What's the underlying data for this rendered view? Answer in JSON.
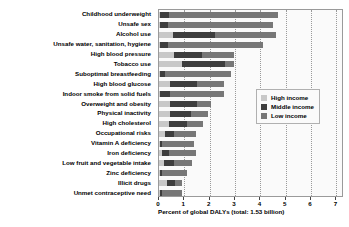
{
  "chart_data": {
    "type": "bar",
    "orientation": "horizontal",
    "stacked": true,
    "title": "",
    "xlabel": "Percent of global DALYs (total: 1.53 billion)",
    "ylabel": "",
    "xlim": [
      0,
      7.3
    ],
    "xticks": [
      0,
      1,
      2,
      3,
      4,
      5,
      6,
      7
    ],
    "xtick_labels": [
      "0",
      "1",
      "2",
      "3",
      "4",
      "5",
      "6",
      "7"
    ],
    "grid": "vertical-dotted",
    "legend_position": "middle-right",
    "categories": [
      "Childhood underweight",
      "Unsafe sex",
      "Alcohol use",
      "Unsafe water, sanitation, hygiene",
      "High blood pressure",
      "Tobacco use",
      "Suboptimal breastfeeding",
      "High blood glucose",
      "Indoor smoke from solid fuels",
      "Overweight and obesity",
      "Physical inactivity",
      "High cholesterol",
      "Occupational risks",
      "Vitamin A deficiency",
      "Iron deficiency",
      "Low fruit and vegetable intake",
      "Zinc deficiency",
      "Illicit drugs",
      "Unmet contraceptive need"
    ],
    "series": [
      {
        "name": "High income",
        "color": "#c8c8c8",
        "values": [
          0.02,
          0.02,
          0.55,
          0.02,
          0.6,
          0.9,
          0.02,
          0.45,
          0.02,
          0.45,
          0.45,
          0.4,
          0.25,
          0.02,
          0.1,
          0.2,
          0.02,
          0.3,
          0.02
        ]
      },
      {
        "name": "Middle income",
        "color": "#3d3d3d",
        "values": [
          0.38,
          0.33,
          1.65,
          0.33,
          1.1,
          1.7,
          0.23,
          1.05,
          0.43,
          1.05,
          0.8,
          0.7,
          0.35,
          0.08,
          0.3,
          0.4,
          0.08,
          0.35,
          0.1
        ]
      },
      {
        "name": "Low income",
        "color": "#777777",
        "values": [
          4.3,
          4.15,
          2.4,
          3.75,
          1.25,
          0.35,
          2.6,
          1.05,
          2.1,
          0.55,
          0.7,
          0.65,
          0.85,
          1.3,
          1.05,
          0.7,
          1.0,
          0.25,
          0.78
        ]
      }
    ],
    "totals": [
      4.7,
      4.5,
      4.6,
      4.1,
      2.95,
      2.95,
      2.85,
      2.55,
      2.55,
      2.05,
      1.95,
      1.75,
      1.45,
      1.4,
      1.45,
      1.3,
      1.1,
      0.9,
      0.9
    ]
  },
  "legend": {
    "items": [
      {
        "label": "High income",
        "key": "hi"
      },
      {
        "label": "Middle income",
        "key": "mid"
      },
      {
        "label": "Low income",
        "key": "low"
      }
    ]
  }
}
